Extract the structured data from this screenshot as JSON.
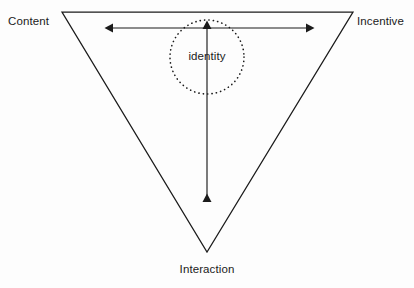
{
  "diagram": {
    "type": "inverted-triangle-framework",
    "title_visible": false,
    "background_color": "#fdfdfd",
    "stroke_color": "#1b1b1b",
    "vertices": {
      "top_left": {
        "label": "Content",
        "x": 62,
        "y": 12
      },
      "top_right": {
        "label": "Incentive",
        "x": 353,
        "y": 12
      },
      "bottom": {
        "label": "Interaction",
        "x": 207,
        "y": 252
      }
    },
    "center_node": {
      "label": "identity",
      "shape": "dotted-circle",
      "cx": 207,
      "cy": 57,
      "r": 37
    },
    "arrows": [
      {
        "name": "horizontal-axis-arrow",
        "orientation": "horizontal",
        "double_headed": true,
        "x1": 112,
        "y1": 28,
        "x2": 307,
        "y2": 28,
        "connects": [
          "Content",
          "Incentive"
        ]
      },
      {
        "name": "vertical-axis-arrow",
        "orientation": "vertical",
        "double_headed": true,
        "x1": 207,
        "y1": 28,
        "x2": 207,
        "y2": 203,
        "connects": [
          "identity",
          "Interaction"
        ]
      }
    ],
    "labels": {
      "content": "Content",
      "incentive": "Incentive",
      "interaction": "Interaction",
      "identity": "identity"
    }
  }
}
